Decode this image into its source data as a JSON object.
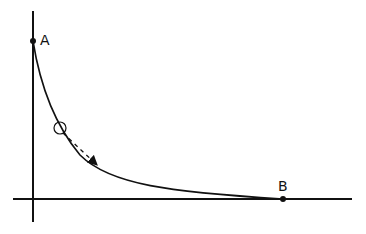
{
  "diagram": {
    "type": "brachistochrone-style curve with rolling ball",
    "colors": {
      "stroke": "#111111",
      "background": "#ffffff"
    },
    "axes": {
      "vertical": {
        "x": 33,
        "y_top": 11,
        "y_bottom": 222
      },
      "horizontal": {
        "y": 199,
        "x_left": 13,
        "x_right": 352
      }
    },
    "points": [
      {
        "label": "A",
        "x": 33,
        "y": 41
      },
      {
        "label": "B",
        "x": 283,
        "y": 199
      }
    ],
    "ball": {
      "cx": 60,
      "cy": 128,
      "r": 6
    },
    "motion_arrow": {
      "style": "dashed",
      "from": [
        62,
        133
      ],
      "to": [
        96,
        164
      ]
    }
  },
  "labels": {
    "a": "A",
    "b": "B"
  }
}
